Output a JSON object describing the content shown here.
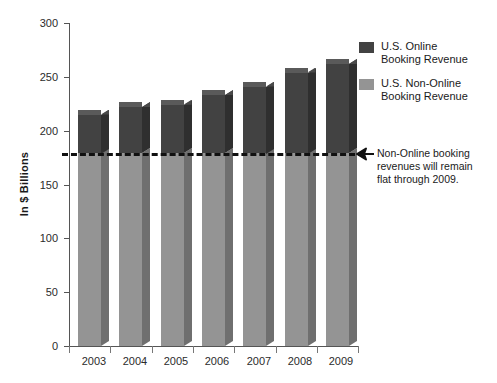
{
  "chart_data": {
    "type": "bar",
    "title": "",
    "subtitle": "",
    "xlabel": "",
    "ylabel": "In $ Billions",
    "categories": [
      "2003",
      "2004",
      "2005",
      "2006",
      "2007",
      "2008",
      "2009"
    ],
    "ylim": [
      0,
      300
    ],
    "yticks": [
      0,
      50,
      100,
      150,
      200,
      250,
      300
    ],
    "ytick_labels": [
      "0",
      "50",
      "100",
      "150",
      "200",
      "250",
      "300"
    ],
    "grid": false,
    "stacked": true,
    "legend_position": "top-right",
    "series": [
      {
        "name": "U.S. Online Booking Revenue",
        "color": "#424242",
        "values": [
          36,
          43,
          45,
          54,
          62,
          75,
          83
        ]
      },
      {
        "name": "U.S. Non-Online Booking Revenue",
        "color": "#949494",
        "values": [
          179,
          179,
          179,
          179,
          179,
          179,
          179
        ]
      }
    ],
    "totals": [
      215,
      222,
      224,
      233,
      241,
      254,
      262
    ],
    "reference_line": {
      "value": 179,
      "style": "dashed",
      "color": "#111111",
      "label": "Non-Online booking revenues will remain flat through 2009."
    },
    "annotations": [
      {
        "text": "Non-Online booking revenues will remain flat through 2009.",
        "target": "reference-line",
        "arrow": true
      }
    ]
  },
  "legend": {
    "items": [
      {
        "label_line1": "U.S. Online",
        "label_line2": "Booking Revenue",
        "color": "#424242"
      },
      {
        "label_line1": "U.S. Non-Online",
        "label_line2": "Booking Revenue",
        "color": "#949494"
      }
    ]
  },
  "annotation": {
    "line1": "Non-Online booking",
    "line2": "revenues will remain",
    "line3": "flat through 2009."
  }
}
